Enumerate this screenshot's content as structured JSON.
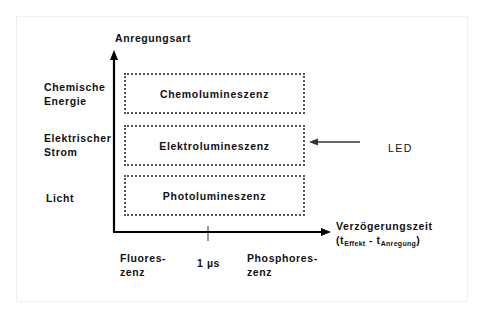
{
  "diagram": {
    "y_axis": {
      "label": "Anregungsart"
    },
    "x_axis": {
      "label": "Verzögerungszeit",
      "formula": {
        "open": "(t",
        "sub1": "Effekt",
        "minus": " - t",
        "sub2": "Anregung",
        "close": ")"
      },
      "tick_label": "1 µs"
    },
    "excitation_types": [
      {
        "line1": "Chemische",
        "line2": "Energie"
      },
      {
        "line1": "Elektrischer",
        "line2": "Strom"
      },
      {
        "line1": "Licht",
        "line2": ""
      }
    ],
    "boxes": [
      {
        "label": "Chemolumineszenz"
      },
      {
        "label": "Elektrolumineszenz"
      },
      {
        "label": "Photolumineszenz"
      }
    ],
    "annotation": {
      "label": "LED"
    },
    "time_regions": [
      {
        "line1": "Fluores-",
        "line2": "zenz"
      },
      {
        "line1": "Phosphores-",
        "line2": "zenz"
      }
    ],
    "colors": {
      "axis": "#000000",
      "box_border": "#555555",
      "text": "#111111"
    }
  }
}
